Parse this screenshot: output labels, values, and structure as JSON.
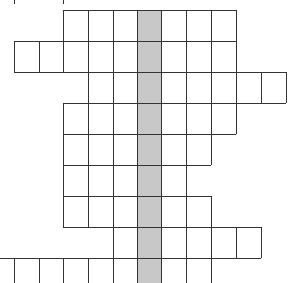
{
  "puzzle": {
    "type": "grid-word-puzzle",
    "column_x": [
      14,
      39,
      63,
      88,
      113,
      137,
      161,
      186,
      211,
      236,
      261,
      286
    ],
    "row_y": [
      10,
      41,
      72,
      103,
      134,
      165,
      196,
      227,
      258,
      283
    ],
    "highlight_column": {
      "x0": 137,
      "x1": 161,
      "y0": 10,
      "y1": 283
    },
    "rows": [
      {
        "y0": 10,
        "y1": 41,
        "x0": 63,
        "x1": 236,
        "closed_bottom": true
      },
      {
        "y0": 41,
        "y1": 72,
        "x0": 14,
        "x1": 236,
        "closed_bottom": true
      },
      {
        "y0": 72,
        "y1": 103,
        "x0": 88,
        "x1": 286,
        "closed_bottom": true
      },
      {
        "y0": 103,
        "y1": 134,
        "x0": 63,
        "x1": 236,
        "closed_bottom": true
      },
      {
        "y0": 134,
        "y1": 165,
        "x0": 63,
        "x1": 211,
        "closed_bottom": true
      },
      {
        "y0": 165,
        "y1": 196,
        "x0": 63,
        "x1": 186,
        "closed_bottom": true
      },
      {
        "y0": 196,
        "y1": 227,
        "x0": 63,
        "x1": 211,
        "closed_bottom": true
      },
      {
        "y0": 227,
        "y1": 258,
        "x0": 113,
        "x1": 261,
        "closed_bottom": true
      },
      {
        "y0": 258,
        "y1": 283,
        "x0": 0,
        "x1": 211,
        "closed_bottom": false
      }
    ],
    "colors": {
      "line": "#333333",
      "highlight": "#c8c8c8",
      "background": "#ffffff"
    }
  }
}
